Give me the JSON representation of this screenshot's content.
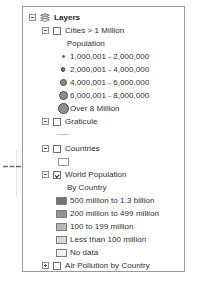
{
  "panel": {
    "name": "Table Of Contents"
  },
  "tree": {
    "root": {
      "label": "Layers",
      "icon": "layers-stack-icon",
      "expander": "minus"
    },
    "groups": [
      {
        "id": "cities",
        "label": "Cities > 1 Million",
        "expander": "minus",
        "checked": false,
        "heading": "Population",
        "symbol_type": "graduated-circles",
        "items": [
          {
            "label": "1,000,001 - 2,000,000",
            "size": "s1",
            "color": "#6e6e6e"
          },
          {
            "label": "2,000,001 - 4,000,000",
            "size": "s2",
            "color": "#767676"
          },
          {
            "label": "4,000,001 - 6,000,000",
            "size": "s3",
            "color": "#8a8a8a"
          },
          {
            "label": "6,000,001 - 8,000,000",
            "size": "s4",
            "color": "#8e8e8e"
          },
          {
            "label": "Over 8 Million",
            "size": "s5",
            "color": "#909090"
          }
        ]
      },
      {
        "id": "graticule",
        "label": "Graticule",
        "expander": "minus",
        "checked": false,
        "symbol_type": "line",
        "items": [
          {
            "label": "",
            "color": "#c9c9c9"
          }
        ]
      },
      {
        "id": "countries",
        "label": "Countries",
        "expander": "minus",
        "checked": false,
        "symbol_type": "hollow-square",
        "items": [
          {
            "label": "",
            "color": "#ffffff"
          }
        ]
      },
      {
        "id": "world-population",
        "label": "World Population",
        "expander": "minus",
        "checked": true,
        "pointed_at": true,
        "heading": "By Country",
        "symbol_type": "graduated-fills",
        "items": [
          {
            "label": "500 million to 1.3 billion",
            "swatch": "sw-1",
            "color": "#6f7277"
          },
          {
            "label": "200 million to 499 million",
            "swatch": "sw-2",
            "color": "#909399"
          },
          {
            "label": "100 to 199 million",
            "swatch": "sw-3",
            "color": "#b6b9bd"
          },
          {
            "label": "Less than 100 million",
            "swatch": "sw-4",
            "color": "#d8dadd"
          },
          {
            "label": "No data",
            "swatch": "sw-5",
            "color": "#f1f2f3"
          }
        ]
      },
      {
        "id": "air-pollution",
        "label": "Air Pollution by Country",
        "expander": "plus",
        "checked": false,
        "symbol_type": "none",
        "items": []
      },
      {
        "id": "ocean",
        "label": "Ocean",
        "expander": "minus",
        "checked": true,
        "symbol_type": "none",
        "items": []
      }
    ]
  },
  "annotation": {
    "arrow": "right-arrow-pointer",
    "target": "World Population"
  }
}
